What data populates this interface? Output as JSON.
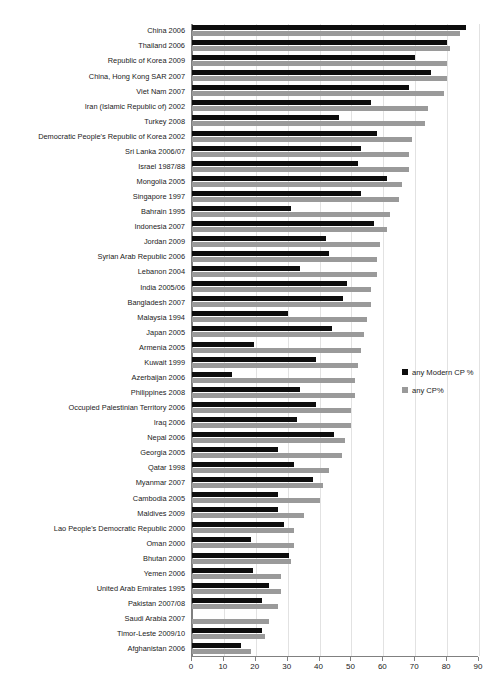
{
  "chart_data": {
    "type": "bar",
    "orientation": "horizontal",
    "grouped": true,
    "title": "",
    "subtitle": "",
    "xlabel": "",
    "ylabel": "",
    "xlim": [
      0,
      90
    ],
    "xticks": [
      0,
      10,
      20,
      30,
      40,
      50,
      60,
      70,
      80,
      90
    ],
    "grid": true,
    "grid_axis": "x",
    "legend_position": "right-middle",
    "categories": [
      "China 2006",
      "Thailand 2006",
      "Republic of Korea 2009",
      "China, Hong Kong SAR 2007",
      "Viet Nam 2007",
      "Iran (Islamic Republic of) 2002",
      "Turkey 2008",
      "Democratic People's Republic of Korea 2002",
      "Sri Lanka 2006/07",
      "Israel 1987/88",
      "Mongolia 2005",
      "Singapore 1997",
      "Bahrain 1995",
      "Indonesia 2007",
      "Jordan 2009",
      "Syrian Arab Republic 2006",
      "Lebanon 2004",
      "India 2005/06",
      "Bangladesh 2007",
      "Malaysia 1994",
      "Japan 2005",
      "Armenia 2005",
      "Kuwait 1999",
      "Azerbaijan 2006",
      "Philippines 2008",
      "Occupied Palestinian Territory 2006",
      "Iraq 2006",
      "Nepal 2006",
      "Georgia 2005",
      "Qatar 1998",
      "Myanmar 2007",
      "Cambodia 2005",
      "Maldives 2009",
      "Lao People's Democratic Republic 2000",
      "Oman 2000",
      "Bhutan 2000",
      "Yemen 2006",
      "United Arab Emirates 1995",
      "Pakistan 2007/08",
      "Saudi Arabia 2007",
      "Timor-Leste 2009/10",
      "Afghanistan 2006"
    ],
    "series": [
      {
        "name": "any Modern CP %",
        "color": "#0d0d0d",
        "values": [
          86.0,
          80.0,
          70.0,
          75.0,
          68.0,
          56.0,
          46.0,
          58.0,
          53.0,
          52.0,
          61.0,
          53.0,
          31.0,
          57.0,
          42.0,
          43.0,
          34.0,
          48.5,
          47.5,
          30.0,
          44.0,
          19.5,
          39.0,
          12.5,
          34.0,
          39.0,
          33.0,
          44.5,
          27.0,
          32.0,
          38.0,
          27.0,
          27.0,
          29.0,
          18.5,
          30.5,
          19.0,
          24.0,
          22.0,
          0.0,
          22.0,
          15.5
        ]
      },
      {
        "name": "any CP%",
        "color": "#9a9a9a",
        "values": [
          84.0,
          81.0,
          80.0,
          80.0,
          79.0,
          74.0,
          73.0,
          69.0,
          68.0,
          68.0,
          66.0,
          65.0,
          62.0,
          61.0,
          59.0,
          58.0,
          58.0,
          56.0,
          56.0,
          55.0,
          54.0,
          53.0,
          52.0,
          51.0,
          51.0,
          50.0,
          50.0,
          48.0,
          47.0,
          43.0,
          41.0,
          40.0,
          35.0,
          32.0,
          32.0,
          31.0,
          28.0,
          28.0,
          27.0,
          24.0,
          23.0,
          18.5
        ]
      }
    ]
  },
  "legend": {
    "items": [
      {
        "label": "any Modern CP %",
        "swatch": "black-square-icon"
      },
      {
        "label": "any CP%",
        "swatch": "gray-square-icon"
      }
    ]
  }
}
